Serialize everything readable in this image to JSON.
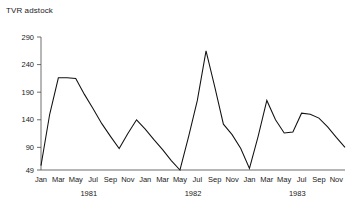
{
  "chart_data": {
    "type": "line",
    "title": "TVR adstock",
    "xlabel": "",
    "ylabel": "",
    "grid": false,
    "legend": null,
    "ylim": [
      49,
      290
    ],
    "yticks": [
      49,
      90,
      140,
      190,
      240,
      290
    ],
    "ytick_labels": [
      "49",
      "90",
      "140",
      "190",
      "240",
      "290"
    ],
    "x_tick_labels": [
      "Jan",
      "Mar",
      "May",
      "Jul",
      "Sep",
      "Nov",
      "Jan",
      "Mar",
      "May",
      "Jul",
      "Sep",
      "Nov",
      "Jan",
      "Mar",
      "May",
      "Jul",
      "Sep",
      "Nov"
    ],
    "year_groups": [
      {
        "label": "1981",
        "start_index": 0,
        "end_index": 11
      },
      {
        "label": "1982",
        "start_index": 12,
        "end_index": 23
      },
      {
        "label": "1983",
        "start_index": 24,
        "end_index": 35
      }
    ],
    "x": [
      "1981-01",
      "1981-02",
      "1981-03",
      "1981-04",
      "1981-05",
      "1981-06",
      "1981-07",
      "1981-08",
      "1981-09",
      "1981-10",
      "1981-11",
      "1981-12",
      "1982-01",
      "1982-02",
      "1982-03",
      "1982-04",
      "1982-05",
      "1982-06",
      "1982-07",
      "1982-08",
      "1982-09",
      "1982-10",
      "1982-11",
      "1982-12",
      "1983-01",
      "1983-02",
      "1983-03",
      "1983-04",
      "1983-05",
      "1983-06",
      "1983-07",
      "1983-08",
      "1983-09",
      "1983-10",
      "1983-11",
      "1983-12"
    ],
    "values": [
      57,
      150,
      216,
      216,
      215,
      186,
      160,
      133,
      110,
      88,
      115,
      140,
      123,
      104,
      86,
      66,
      49,
      110,
      175,
      265,
      200,
      132,
      113,
      88,
      52,
      110,
      175,
      140,
      116,
      118,
      152,
      150,
      143,
      127,
      108,
      90
    ],
    "series_name": "TVR adstock",
    "line_color": "#111111"
  }
}
